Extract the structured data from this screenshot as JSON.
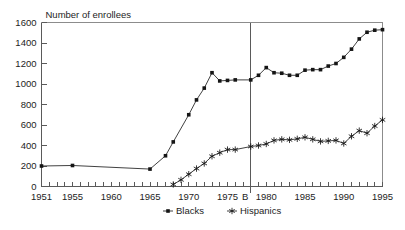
{
  "chart_data": {
    "type": "line",
    "title": "",
    "ylabel": "Number of enrollees",
    "xlabel": "",
    "xlim": [
      1951,
      1995
    ],
    "ylim": [
      0,
      1600
    ],
    "grid": false,
    "legend_position": "bottom-center",
    "y_ticks": [
      0,
      200,
      400,
      600,
      800,
      1000,
      1200,
      1400,
      1600
    ],
    "y_tick_labels": [
      "0",
      "200",
      "400",
      "600",
      "800",
      "1000",
      "1200",
      "1400",
      "1600"
    ],
    "x_major_ticks": [
      1951,
      1955,
      1960,
      1965,
      1970,
      1975,
      1980,
      1985,
      1990,
      1995
    ],
    "x_major_tick_labels": [
      "1951",
      "1955",
      "1960",
      "1965",
      "1970",
      "1975",
      "1980",
      "1985",
      "1990",
      "1995"
    ],
    "x_minor_tick_step": 1,
    "annotations": [
      {
        "name": "reference-line-b",
        "label": "B",
        "x": 1978,
        "type": "vertical-line"
      }
    ],
    "series": [
      {
        "name": "Blacks",
        "marker": "filled-square",
        "color": "#151515",
        "points": [
          {
            "x": 1951,
            "y": 200
          },
          {
            "x": 1955,
            "y": 205
          },
          {
            "x": 1965,
            "y": 170
          },
          {
            "x": 1967,
            "y": 300
          },
          {
            "x": 1968,
            "y": 435
          },
          {
            "x": 1970,
            "y": 700
          },
          {
            "x": 1971,
            "y": 845
          },
          {
            "x": 1972,
            "y": 960
          },
          {
            "x": 1973,
            "y": 1110
          },
          {
            "x": 1974,
            "y": 1030
          },
          {
            "x": 1975,
            "y": 1035
          },
          {
            "x": 1976,
            "y": 1040
          },
          {
            "x": 1978,
            "y": 1040
          },
          {
            "x": 1979,
            "y": 1085
          },
          {
            "x": 1980,
            "y": 1160
          },
          {
            "x": 1981,
            "y": 1110
          },
          {
            "x": 1982,
            "y": 1105
          },
          {
            "x": 1983,
            "y": 1085
          },
          {
            "x": 1984,
            "y": 1085
          },
          {
            "x": 1985,
            "y": 1135
          },
          {
            "x": 1986,
            "y": 1140
          },
          {
            "x": 1987,
            "y": 1140
          },
          {
            "x": 1988,
            "y": 1175
          },
          {
            "x": 1989,
            "y": 1200
          },
          {
            "x": 1990,
            "y": 1260
          },
          {
            "x": 1991,
            "y": 1340
          },
          {
            "x": 1992,
            "y": 1440
          },
          {
            "x": 1993,
            "y": 1505
          },
          {
            "x": 1994,
            "y": 1525
          },
          {
            "x": 1995,
            "y": 1530
          }
        ]
      },
      {
        "name": "Hispanics",
        "marker": "star",
        "color": "#151515",
        "points": [
          {
            "x": 1968,
            "y": 20
          },
          {
            "x": 1969,
            "y": 65
          },
          {
            "x": 1970,
            "y": 120
          },
          {
            "x": 1971,
            "y": 175
          },
          {
            "x": 1972,
            "y": 225
          },
          {
            "x": 1973,
            "y": 295
          },
          {
            "x": 1974,
            "y": 330
          },
          {
            "x": 1975,
            "y": 360
          },
          {
            "x": 1976,
            "y": 360
          },
          {
            "x": 1978,
            "y": 390
          },
          {
            "x": 1979,
            "y": 400
          },
          {
            "x": 1980,
            "y": 415
          },
          {
            "x": 1981,
            "y": 450
          },
          {
            "x": 1982,
            "y": 460
          },
          {
            "x": 1983,
            "y": 455
          },
          {
            "x": 1984,
            "y": 465
          },
          {
            "x": 1985,
            "y": 480
          },
          {
            "x": 1986,
            "y": 460
          },
          {
            "x": 1987,
            "y": 440
          },
          {
            "x": 1988,
            "y": 445
          },
          {
            "x": 1989,
            "y": 450
          },
          {
            "x": 1990,
            "y": 420
          },
          {
            "x": 1991,
            "y": 490
          },
          {
            "x": 1992,
            "y": 545
          },
          {
            "x": 1993,
            "y": 520
          },
          {
            "x": 1994,
            "y": 590
          },
          {
            "x": 1995,
            "y": 650
          }
        ]
      }
    ],
    "legend": [
      {
        "label": "Blacks",
        "marker": "filled-square"
      },
      {
        "label": "Hispanics",
        "marker": "star"
      }
    ]
  }
}
